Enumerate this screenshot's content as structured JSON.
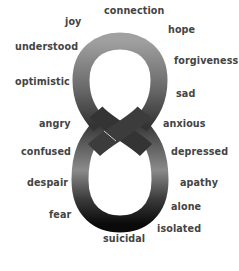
{
  "diagram": {
    "shape": "figure-eight",
    "colors": {
      "background": "#ffffff",
      "text": "#444444",
      "loop_top_light": "#9a9a9a",
      "loop_top_dark": "#3a3a3a",
      "loop_bottom_dark": "#111111",
      "loop_bottom_mid": "#8a8a8a"
    },
    "words": [
      {
        "text": "connection",
        "x": 104,
        "y": 14
      },
      {
        "text": "joy",
        "x": 65,
        "y": 25
      },
      {
        "text": "hope",
        "x": 168,
        "y": 33
      },
      {
        "text": "understood",
        "x": 15,
        "y": 50
      },
      {
        "text": "forgiveness",
        "x": 174,
        "y": 64
      },
      {
        "text": "optimistic",
        "x": 15,
        "y": 85
      },
      {
        "text": "sad",
        "x": 176,
        "y": 97
      },
      {
        "text": "angry",
        "x": 39,
        "y": 127
      },
      {
        "text": "anxious",
        "x": 163,
        "y": 127
      },
      {
        "text": "confused",
        "x": 21,
        "y": 155
      },
      {
        "text": "depressed",
        "x": 171,
        "y": 155
      },
      {
        "text": "despair",
        "x": 27,
        "y": 186
      },
      {
        "text": "apathy",
        "x": 180,
        "y": 186
      },
      {
        "text": "alone",
        "x": 171,
        "y": 210
      },
      {
        "text": "fear",
        "x": 49,
        "y": 218
      },
      {
        "text": "isolated",
        "x": 157,
        "y": 232
      },
      {
        "text": "suicidal",
        "x": 103,
        "y": 242
      }
    ]
  }
}
